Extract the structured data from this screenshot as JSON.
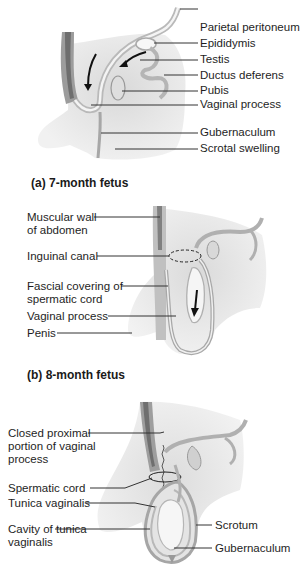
{
  "panels": [
    {
      "id": "a",
      "caption": "(a) 7-month fetus",
      "labels": [
        "Parietal peritoneum",
        "Epididymis",
        "Testis",
        "Ductus deferens",
        "Pubis",
        "Vaginal process",
        "Gubernaculum",
        "Scrotal swelling"
      ]
    },
    {
      "id": "b",
      "caption": "(b) 8-month fetus",
      "labels": [
        "Muscular wall of abdomen",
        "Inguinal canal",
        "Fascial covering of spermatic cord",
        "Vaginal process",
        "Penis"
      ]
    },
    {
      "id": "c",
      "caption": "",
      "labels": [
        "Closed proximal portion of vaginal process",
        "Spermatic cord",
        "Tunica vaginalis",
        "Cavity of tunica vaginalis",
        "Scrotum",
        "Gubernaculum"
      ]
    }
  ],
  "colors": {
    "tissue_light": "#e9e9e9",
    "tissue_mid": "#d2d2d2",
    "tissue_dark": "#9a9a9a",
    "leader_line": "#333333",
    "arrow": "#111111"
  }
}
